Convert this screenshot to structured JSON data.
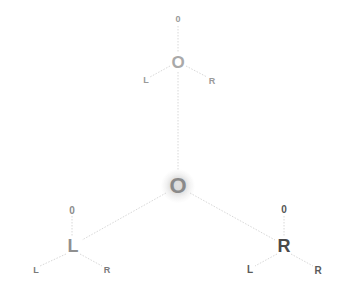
{
  "diagram": {
    "top_node": {
      "label": "O",
      "top_child": "0",
      "left_child": "L",
      "right_child": "R"
    },
    "center_node": {
      "label": "O"
    },
    "left_node": {
      "label": "L",
      "top_child": "0",
      "left_child": "L",
      "right_child": "R"
    },
    "right_node": {
      "label": "R",
      "top_child": "0",
      "left_child": "L",
      "right_child": "R"
    }
  },
  "colors": {
    "edge": "#d8d8d8",
    "text_light": "#a9a9a9",
    "text_dark": "#4a4a4a"
  }
}
